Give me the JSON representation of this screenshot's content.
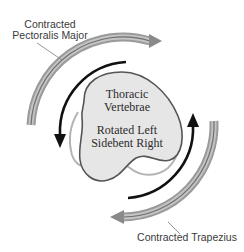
{
  "diagram": {
    "muscles": {
      "top": {
        "line1": "Contracted",
        "line2": "Pectoralis Major"
      },
      "bottom": {
        "label": "Contracted Trapezius"
      }
    },
    "vertebra": {
      "name_line1": "Thoracic",
      "name_line2": "Vertebrae",
      "state_line1": "Rotated Left",
      "state_line2": "Sidebent Right"
    },
    "colors": {
      "muscle_band": "#a8a8a8",
      "muscle_band_dark": "#6e6e6e",
      "rotation_arrow": "#111111",
      "vertebra_fill": "#e6e6e6",
      "vertebra_outline": "#555555",
      "vertebra_shadow_outline": "#b4b4b4",
      "leader_line": "#8a8a8a"
    }
  }
}
